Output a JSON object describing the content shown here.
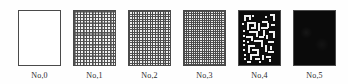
{
  "figure": {
    "background_color": "#fefefe",
    "border_color": "#4a4a4a",
    "panel_count": 6,
    "panels": [
      {
        "id": "panel-0",
        "caption": "No,0",
        "texture": "blank",
        "fill_color": "#ffffff",
        "density": 0.0
      },
      {
        "id": "panel-1",
        "caption": "No,1",
        "texture": "coarse-irregular-grid",
        "fill_color": "#f2f2f2",
        "density": 0.35
      },
      {
        "id": "panel-2",
        "caption": "No,2",
        "texture": "medium-regular-grid",
        "fill_color": "#ededed",
        "density": 0.5
      },
      {
        "id": "panel-3",
        "caption": "No,3",
        "texture": "fine-uniform-grid",
        "fill_color": "#e9e9e9",
        "density": 0.65
      },
      {
        "id": "panel-4",
        "caption": "No,4",
        "texture": "black-maze-blocks",
        "fill_color": "#0c0c0c",
        "density": 0.85
      },
      {
        "id": "panel-5",
        "caption": "No,5",
        "texture": "solid-black",
        "fill_color": "#0a0a0a",
        "density": 1.0
      }
    ]
  }
}
